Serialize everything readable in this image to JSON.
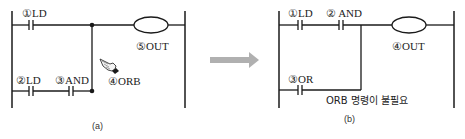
{
  "diagram_a": {
    "caption": "(a)",
    "contacts": [
      {
        "label": "①LD"
      },
      {
        "label": "②LD"
      },
      {
        "label": "③AND"
      }
    ],
    "orb_label": "④ORB",
    "coil_label": "⑤OUT",
    "pointer_icon": "pointing-hand"
  },
  "arrow": {
    "direction": "right",
    "color": "#b0b0b0"
  },
  "diagram_b": {
    "caption": "(b)",
    "contacts": [
      {
        "label": "①LD"
      },
      {
        "label": "② AND"
      },
      {
        "label": "③OR"
      }
    ],
    "coil_label": "④OUT",
    "note": "ORB 명령이 불필요"
  },
  "colors": {
    "line": "#1a1a1a",
    "arrow": "#b0b0b0",
    "text": "#222222"
  }
}
